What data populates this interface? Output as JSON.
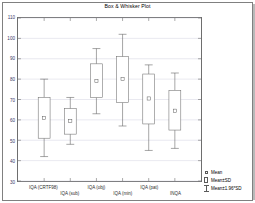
{
  "figure": {
    "title": "Box & Whisker Plot",
    "background": "#ffffff",
    "frame_color": "#808080"
  },
  "chart_data": {
    "type": "box",
    "title": "Box & Whisker Plot",
    "xlabel": "",
    "ylabel": "",
    "ylim": [
      30,
      110
    ],
    "yticks": [
      30,
      40,
      50,
      60,
      70,
      80,
      90,
      100,
      110
    ],
    "ytick_labels": [
      "30",
      "40",
      "50",
      "60",
      "70",
      "80",
      "90",
      "100",
      "110"
    ],
    "grid": true,
    "grid_color": "#c8c8d8",
    "legend_position": "bottom-right",
    "legend": [
      {
        "key": "mean",
        "label": "Mean",
        "marker": "small-square"
      },
      {
        "key": "mean_sd",
        "label": "Mean±SD",
        "marker": "box"
      },
      {
        "key": "mean_ci",
        "label": "Mean±1.96*SD",
        "marker": "whisker"
      }
    ],
    "categories": [
      "IQA (CRTF98)",
      "IQA (sub)",
      "IQA (obj)",
      "IQA (min)",
      "IQA (pat)",
      "INQA"
    ],
    "boxes": [
      {
        "category": "IQA (CRTF98)",
        "whisker_low": 42.0,
        "box_low": 51.0,
        "mean": 61.0,
        "box_high": 71.0,
        "whisker_high": 80.0
      },
      {
        "category": "IQA (sub)",
        "whisker_low": 48.0,
        "box_low": 53.0,
        "mean": 59.5,
        "box_high": 65.5,
        "whisker_high": 71.0
      },
      {
        "category": "IQA (obj)",
        "whisker_low": 63.0,
        "box_low": 71.0,
        "mean": 79.0,
        "box_high": 87.5,
        "whisker_high": 95.0
      },
      {
        "category": "IQA (min)",
        "whisker_low": 57.0,
        "box_low": 68.5,
        "mean": 80.0,
        "box_high": 91.0,
        "whisker_high": 102.0
      },
      {
        "category": "IQA (pat)",
        "whisker_low": 45.0,
        "box_low": 58.0,
        "mean": 70.5,
        "box_high": 82.5,
        "whisker_high": 87.0
      },
      {
        "category": "INQA",
        "whisker_low": 46.0,
        "box_low": 55.0,
        "mean": 64.5,
        "box_high": 74.5,
        "whisker_high": 83.0
      }
    ],
    "series": [
      {
        "name": "Mean",
        "values": [
          61.0,
          59.5,
          79.0,
          80.0,
          70.5,
          64.5
        ]
      },
      {
        "name": "Mean±SD",
        "values": [
          [
            51.0,
            71.0
          ],
          [
            53.0,
            65.5
          ],
          [
            71.0,
            87.5
          ],
          [
            68.5,
            91.0
          ],
          [
            58.0,
            82.5
          ],
          [
            55.0,
            74.5
          ]
        ]
      },
      {
        "name": "Mean±1.96*SD",
        "values": [
          [
            42.0,
            80.0
          ],
          [
            48.0,
            71.0
          ],
          [
            63.0,
            95.0
          ],
          [
            57.0,
            102.0
          ],
          [
            45.0,
            87.0
          ],
          [
            46.0,
            83.0
          ]
        ]
      }
    ]
  }
}
